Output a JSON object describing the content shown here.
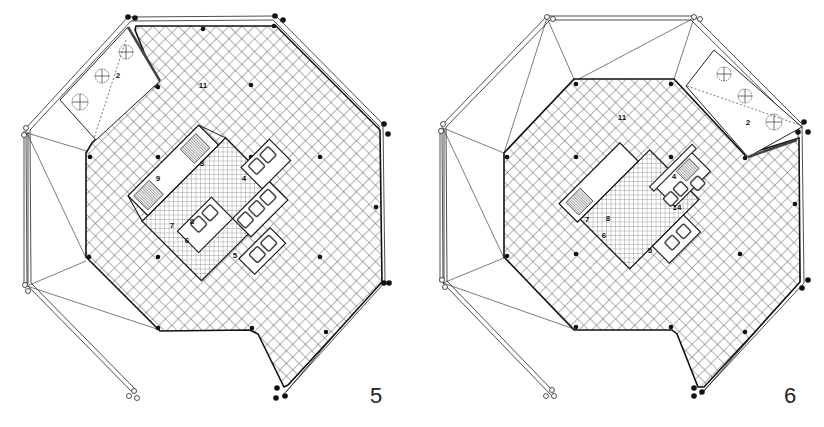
{
  "figures": [
    {
      "id": "plan-5",
      "figure_number": "5",
      "room_labels": [
        {
          "text": "11",
          "x": 203,
          "y": 88
        },
        {
          "text": "2",
          "x": 118,
          "y": 78
        },
        {
          "text": "3",
          "x": 202,
          "y": 166
        },
        {
          "text": "4",
          "x": 244,
          "y": 181
        },
        {
          "text": "9",
          "x": 158,
          "y": 181
        },
        {
          "text": "7",
          "x": 172,
          "y": 228
        },
        {
          "text": "8",
          "x": 192,
          "y": 224
        },
        {
          "text": "6",
          "x": 187,
          "y": 243
        },
        {
          "text": "5",
          "x": 235,
          "y": 258
        }
      ]
    },
    {
      "id": "plan-6",
      "figure_number": "6",
      "room_labels": [
        {
          "text": "11",
          "x": 210,
          "y": 120
        },
        {
          "text": "2",
          "x": 336,
          "y": 125
        },
        {
          "text": "4",
          "x": 262,
          "y": 179
        },
        {
          "text": "14",
          "x": 265,
          "y": 210
        },
        {
          "text": "7",
          "x": 175,
          "y": 222
        },
        {
          "text": "8",
          "x": 196,
          "y": 221
        },
        {
          "text": "6",
          "x": 192,
          "y": 238
        },
        {
          "text": "5",
          "x": 238,
          "y": 253
        }
      ]
    }
  ],
  "colors": {
    "ink": "#1a1a1a",
    "grid": "#555555",
    "paper": "#ffffff"
  }
}
